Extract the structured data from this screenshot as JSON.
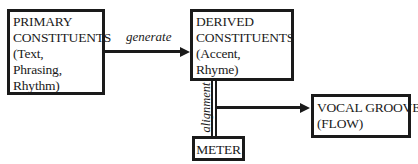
{
  "diagram": {
    "nodes": {
      "primary": {
        "lines": [
          "PRIMARY",
          "CONSTITUENTS",
          "(Text,",
          "Phrasing,",
          "Rhythm)"
        ]
      },
      "derived": {
        "lines": [
          "DERIVED",
          "CONSTITUENTS",
          "(Accent,",
          "Rhyme)"
        ]
      },
      "meter": {
        "lines": [
          "METER"
        ]
      },
      "vocal_groove": {
        "lines": [
          "VOCAL GROOVE",
          "(FLOW)"
        ]
      }
    },
    "edges": [
      {
        "from": "primary",
        "to": "derived",
        "label": "generate",
        "style": "arrow"
      },
      {
        "from": "derived",
        "to": "meter",
        "label": "alignment",
        "style": "double-line"
      },
      {
        "from": "alignment-link",
        "to": "vocal_groove",
        "label": "",
        "style": "arrow"
      }
    ],
    "edge_labels": {
      "generate": "generate",
      "alignment": "alignment"
    },
    "colors": {
      "stroke": "#1a1a1a",
      "background": "#ffffff"
    }
  }
}
